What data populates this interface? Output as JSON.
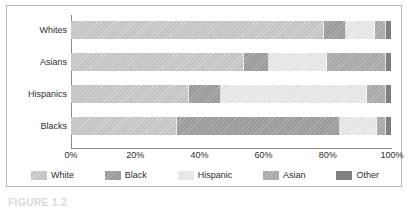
{
  "caption": "FIGURE 1.2",
  "chart_data": {
    "type": "bar",
    "orientation": "horizontal",
    "stacked": true,
    "normalized_percent": true,
    "title": "",
    "subtitle": "",
    "xlabel": "",
    "ylabel": "",
    "xlim": [
      0,
      100
    ],
    "xticks": [
      "0%",
      "20%",
      "40%",
      "60%",
      "80%",
      "100%"
    ],
    "xtick_values": [
      0,
      20,
      40,
      60,
      80,
      100
    ],
    "grid": false,
    "legend_position": "bottom",
    "categories": [
      "Whites",
      "Asians",
      "Hispanics",
      "Blacks"
    ],
    "series": [
      {
        "name": "White",
        "color": "#c3c3c3",
        "values": [
          79.0,
          54.0,
          37.0,
          33.0
        ]
      },
      {
        "name": "Black",
        "color": "#9a9a9a",
        "values": [
          7.0,
          8.0,
          10.0,
          51.0
        ]
      },
      {
        "name": "Hispanic",
        "color": "#ececec",
        "values": [
          9.0,
          18.0,
          45.5,
          11.5
        ]
      },
      {
        "name": "Asian",
        "color": "#a8a8a8",
        "values": [
          3.5,
          18.5,
          6.0,
          3.0
        ]
      },
      {
        "name": "Other",
        "color": "#808080",
        "values": [
          1.5,
          1.5,
          1.5,
          1.5
        ]
      }
    ]
  }
}
